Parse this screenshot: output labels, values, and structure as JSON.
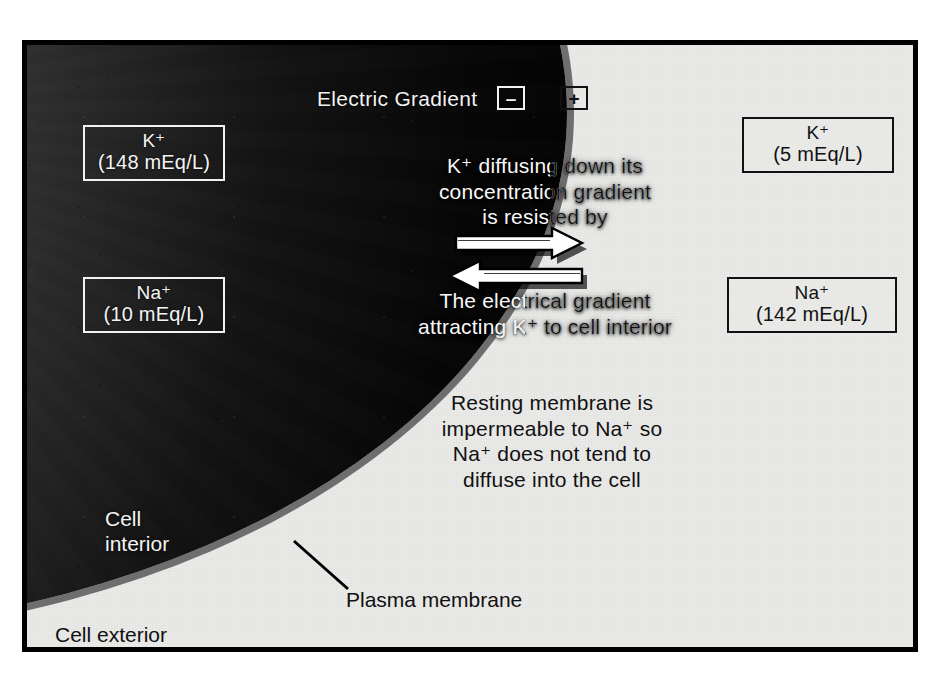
{
  "figure": {
    "accent_dark": "#070707",
    "accent_light": "#e9e9e7",
    "membrane_color": "#6e6e6e"
  },
  "header": {
    "electric_gradient_label": "Electric Gradient",
    "minus_sign": "–",
    "plus_sign": "+"
  },
  "concentrations": {
    "inside": [
      {
        "name": "k-inside",
        "ion": "K⁺",
        "value": "(148 mEq/L)"
      },
      {
        "name": "na-inside",
        "ion": "Na⁺",
        "value": "(10 mEq/L)"
      }
    ],
    "outside": [
      {
        "name": "k-outside",
        "ion": "K⁺",
        "value": "(5 mEq/L)"
      },
      {
        "name": "na-outside",
        "ion": "Na⁺",
        "value": "(142 mEq/L)"
      }
    ]
  },
  "annotations": {
    "diffusion": {
      "line1": "K⁺ diffusing down its",
      "line2": "concentration gradient",
      "line3": "is resisted by"
    },
    "electrical": {
      "line1": "The electrical gradient",
      "line2": "attracting K⁺ to cell interior"
    },
    "resting": {
      "line1": "Resting membrane is",
      "line2": "impermeable to Na⁺ so",
      "line3": "Na⁺ does not tend to",
      "line4": "diffuse into the cell"
    }
  },
  "labels": {
    "cell_interior_line1": "Cell",
    "cell_interior_line2": "interior",
    "cell_exterior": "Cell exterior",
    "plasma_membrane": "Plasma membrane"
  },
  "arrows": {
    "outward": "K+ diffusion arrow pointing out of the cell",
    "inward": "electrical gradient arrow pointing into the cell"
  }
}
